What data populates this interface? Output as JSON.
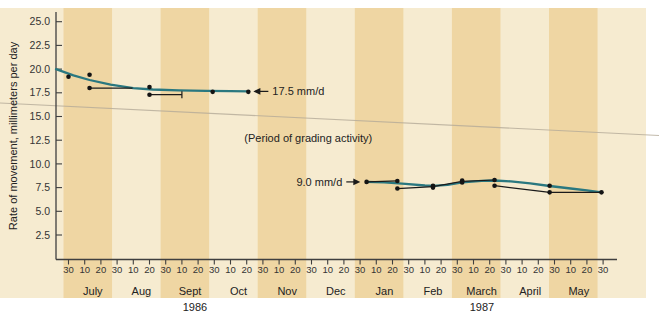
{
  "figure": {
    "ylabel": "Rate of movement, millimeters per day",
    "annotations": {
      "rate_1986": "17.5 mm/d",
      "rate_1987": "9.0 mm/d",
      "grading": "(Period of grading activity)"
    }
  },
  "palette": {
    "page": "#ffffff",
    "panel_light": "#f6ebd0",
    "stripe_dark": "#efd6a3",
    "axis": "#3f3f3f",
    "tick_text": "#343434",
    "label_text": "#222222",
    "curve": "#2a7880",
    "dot": "#141414",
    "segment": "#1a1a1a",
    "crease": "#b5ab99"
  },
  "chart_data": {
    "type": "line",
    "title": "",
    "xlabel": "",
    "ylabel": "Rate of movement, millimeters per day",
    "ylim": [
      0,
      26.3
    ],
    "y_ticks": [
      25.0,
      22.5,
      20.0,
      17.5,
      15.0,
      12.5,
      10.0,
      7.5,
      5.0,
      2.5
    ],
    "x_tick_labels": [
      "30",
      "10",
      "20",
      "30",
      "10",
      "20",
      "30",
      "10",
      "20",
      "30",
      "10",
      "20",
      "30",
      "10",
      "20",
      "30",
      "10",
      "20",
      "30",
      "10",
      "20",
      "30",
      "10",
      "20",
      "30",
      "10",
      "20",
      "30",
      "10",
      "20",
      "30",
      "10",
      "20",
      "30"
    ],
    "months": [
      "July",
      "Aug",
      "Sept",
      "Oct",
      "Nov",
      "Dec",
      "Jan",
      "Feb",
      "March",
      "April",
      "May"
    ],
    "years": [
      "1986",
      "1987"
    ],
    "t_unit": "axis tick units: 1 unit = 10 days, t=0 at the June 30 1986 tick",
    "grid": false,
    "legend": "none",
    "series": [
      {
        "name": "smoothed trend Jul-Oct 1986 (levels off near 17.5 mm/d)",
        "kind": "smooth-curve",
        "points": [
          [
            -0.77,
            20.0
          ],
          [
            0.3,
            19.35
          ],
          [
            1.3,
            18.85
          ],
          [
            2.6,
            18.35
          ],
          [
            4.0,
            18.0
          ],
          [
            5.2,
            17.85
          ],
          [
            6.8,
            17.75
          ],
          [
            8.5,
            17.7
          ],
          [
            10.0,
            17.67
          ],
          [
            11.15,
            17.65
          ]
        ]
      },
      {
        "name": "smoothed trend Jan-May 1987 (about 8 mm/d declining to 7)",
        "kind": "smooth-curve",
        "points": [
          [
            18.4,
            8.1
          ],
          [
            19.5,
            8.05
          ],
          [
            20.8,
            7.9
          ],
          [
            22.0,
            7.72
          ],
          [
            22.5,
            7.68
          ],
          [
            23.4,
            7.8
          ],
          [
            24.3,
            8.05
          ],
          [
            25.5,
            8.22
          ],
          [
            26.3,
            8.25
          ],
          [
            27.3,
            8.15
          ],
          [
            28.5,
            7.95
          ],
          [
            29.7,
            7.67
          ],
          [
            31.0,
            7.4
          ],
          [
            32.0,
            7.2
          ],
          [
            32.9,
            7.0
          ]
        ]
      }
    ],
    "measured_points_1986": [
      [
        0,
        19.2
      ],
      [
        1.3,
        19.4
      ],
      [
        1.3,
        18.0
      ],
      [
        5.0,
        18.1
      ],
      [
        5.0,
        17.3
      ],
      [
        8.9,
        17.6
      ],
      [
        11.1,
        17.6
      ]
    ],
    "measured_points_1987": [
      [
        18.4,
        8.1
      ],
      [
        20.3,
        8.2
      ],
      [
        20.3,
        7.4
      ],
      [
        22.5,
        7.7
      ],
      [
        22.5,
        7.5
      ],
      [
        24.3,
        8.25
      ],
      [
        24.3,
        8.05
      ],
      [
        26.3,
        8.3
      ],
      [
        26.3,
        7.7
      ],
      [
        29.7,
        7.7
      ],
      [
        29.7,
        7.0
      ],
      [
        32.9,
        7.0
      ]
    ],
    "measurement_segments": [
      {
        "pts": [
          [
            1.3,
            18.0
          ],
          [
            3.95,
            18.0
          ]
        ],
        "cap": false
      },
      {
        "pts": [
          [
            5.0,
            17.3
          ],
          [
            7.0,
            17.3
          ]
        ],
        "cap": true
      },
      {
        "pts": [
          [
            18.4,
            8.1
          ],
          [
            20.3,
            8.2
          ]
        ],
        "cap": false
      },
      {
        "pts": [
          [
            20.3,
            7.4
          ],
          [
            22.5,
            7.6
          ]
        ],
        "cap": false
      },
      {
        "pts": [
          [
            22.5,
            7.6
          ],
          [
            24.3,
            8.15
          ]
        ],
        "cap": false
      },
      {
        "pts": [
          [
            24.3,
            8.15
          ],
          [
            26.3,
            8.3
          ]
        ],
        "cap": false
      },
      {
        "pts": [
          [
            26.3,
            7.7
          ],
          [
            29.7,
            7.0
          ]
        ],
        "cap": false
      },
      {
        "pts": [
          [
            29.7,
            7.0
          ],
          [
            32.9,
            7.0
          ]
        ],
        "cap": false
      }
    ],
    "annotations": [
      {
        "text": "17.5 mm/d",
        "arrow": "left",
        "t": 11.35,
        "v": 17.65
      },
      {
        "text": "9.0 mm/d",
        "arrow": "right",
        "t": 17.95,
        "v": 8.1
      },
      {
        "text": "(Period of grading activity)",
        "arrow": "none",
        "t": 14.8,
        "v": 12.7
      }
    ]
  }
}
